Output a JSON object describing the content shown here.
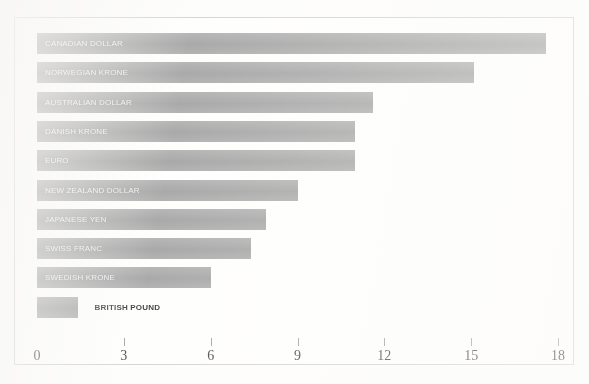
{
  "chart_data": {
    "type": "bar",
    "orientation": "horizontal",
    "title": "",
    "subtitle": "",
    "xlabel": "",
    "ylabel": "",
    "categories": [
      "CANADIAN DOLLAR",
      "NORWEGIAN KRONE",
      "AUSTRALIAN DOLLAR",
      "DANISH KRONE",
      "EURO",
      "NEW ZEALAND DOLLAR",
      "JAPANESE YEN",
      "SWISS FRANC",
      "SWEDISH KRONE",
      "BRITISH POUND"
    ],
    "values": [
      17.6,
      15.1,
      11.6,
      11.0,
      11.0,
      9.0,
      7.9,
      7.4,
      6.0,
      1.4
    ],
    "bars": [
      {
        "label": "CANADIAN DOLLAR",
        "value": 17.6,
        "label_position": "inside"
      },
      {
        "label": "NORWEGIAN KRONE",
        "value": 15.1,
        "label_position": "inside"
      },
      {
        "label": "AUSTRALIAN DOLLAR",
        "value": 11.6,
        "label_position": "inside"
      },
      {
        "label": "DANISH KRONE",
        "value": 11.0,
        "label_position": "inside"
      },
      {
        "label": "EURO",
        "value": 11.0,
        "label_position": "inside"
      },
      {
        "label": "NEW ZEALAND DOLLAR",
        "value": 9.0,
        "label_position": "inside"
      },
      {
        "label": "JAPANESE YEN",
        "value": 7.9,
        "label_position": "inside"
      },
      {
        "label": "SWISS FRANC",
        "value": 7.4,
        "label_position": "inside"
      },
      {
        "label": "SWEDISH KRONE",
        "value": 6.0,
        "label_position": "inside"
      },
      {
        "label": "BRITISH POUND",
        "value": 1.4,
        "label_position": "outside"
      }
    ],
    "xlim": [
      0,
      18
    ],
    "xticks": [
      0,
      3,
      6,
      9,
      12,
      15,
      18
    ],
    "xtick_labels": [
      "0",
      "3",
      "6",
      "9",
      "12",
      "15",
      "18"
    ],
    "grid": false,
    "legend": false,
    "legend_position": "none",
    "bar_color": "#a3a3a3",
    "inside_label_color": "#f2f2f2",
    "outside_label_color": "#2e2c2b",
    "frame_color": "#d2d0cd",
    "background_color": "#fefefd",
    "axis_tick_color": "#9e9c99"
  }
}
